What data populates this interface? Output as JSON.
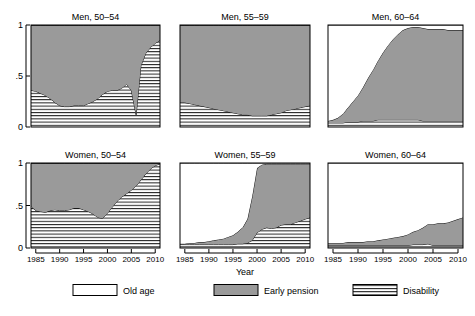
{
  "figure": {
    "xlabel": "Year",
    "ylabel": "",
    "xticks": [
      "1985",
      "1990",
      "1995",
      "2000",
      "2005",
      "2010"
    ],
    "yticks": [
      "0",
      ".5",
      "1"
    ],
    "legend": [
      {
        "key": "old-age",
        "label": "Old age",
        "fill": "#ffffff",
        "pattern": "solid"
      },
      {
        "key": "early-pension",
        "label": "Early pension",
        "fill": "#9a9a9a",
        "pattern": "solid"
      },
      {
        "key": "disability",
        "label": "Disability",
        "fill": "#ffffff",
        "pattern": "horizontal-lines"
      }
    ]
  },
  "chart_data": {
    "type": "area",
    "title": "",
    "xlabel": "Year",
    "ylabel": "",
    "xlim": [
      1984,
      2011
    ],
    "ylim": [
      0,
      1
    ],
    "grid": false,
    "legend_position": "bottom",
    "stack_order": [
      "disability",
      "early_pension",
      "old_age"
    ],
    "panels": [
      {
        "title": "Men, 50–54",
        "row": 0,
        "col": 0,
        "x": [
          1984,
          1985,
          1986,
          1987,
          1988,
          1989,
          1990,
          1991,
          1992,
          1993,
          1994,
          1995,
          1996,
          1997,
          1998,
          1999,
          2000,
          2001,
          2002,
          2003,
          2004,
          2005,
          2006,
          2007,
          2008,
          2009,
          2010,
          2011
        ],
        "series": [
          {
            "name": "Disability",
            "values": [
              0.36,
              0.35,
              0.33,
              0.31,
              0.28,
              0.24,
              0.21,
              0.2,
              0.2,
              0.21,
              0.21,
              0.21,
              0.23,
              0.25,
              0.28,
              0.32,
              0.35,
              0.36,
              0.36,
              0.38,
              0.42,
              0.36,
              0.12,
              0.6,
              0.72,
              0.78,
              0.82,
              0.85
            ]
          },
          {
            "name": "Early pension",
            "values": [
              0.64,
              0.65,
              0.67,
              0.69,
              0.72,
              0.76,
              0.79,
              0.8,
              0.8,
              0.79,
              0.79,
              0.79,
              0.77,
              0.75,
              0.72,
              0.68,
              0.65,
              0.64,
              0.64,
              0.62,
              0.58,
              0.64,
              0.88,
              0.4,
              0.28,
              0.22,
              0.18,
              0.15
            ]
          },
          {
            "name": "Old age",
            "values": [
              0.0,
              0.0,
              0.0,
              0.0,
              0.0,
              0.0,
              0.0,
              0.0,
              0.0,
              0.0,
              0.0,
              0.0,
              0.0,
              0.0,
              0.0,
              0.0,
              0.0,
              0.0,
              0.0,
              0.0,
              0.0,
              0.0,
              0.0,
              0.0,
              0.0,
              0.0,
              0.0,
              0.0
            ]
          }
        ]
      },
      {
        "title": "Men, 55–59",
        "row": 0,
        "col": 1,
        "x": [
          1984,
          1985,
          1986,
          1987,
          1988,
          1989,
          1990,
          1991,
          1992,
          1993,
          1994,
          1995,
          1996,
          1997,
          1998,
          1999,
          2000,
          2001,
          2002,
          2003,
          2004,
          2005,
          2006,
          2007,
          2008,
          2009,
          2010,
          2011
        ],
        "series": [
          {
            "name": "Disability",
            "values": [
              0.24,
              0.24,
              0.23,
              0.22,
              0.21,
              0.2,
              0.19,
              0.18,
              0.17,
              0.16,
              0.15,
              0.14,
              0.13,
              0.12,
              0.12,
              0.11,
              0.11,
              0.11,
              0.11,
              0.12,
              0.13,
              0.14,
              0.16,
              0.17,
              0.18,
              0.19,
              0.2,
              0.21
            ]
          },
          {
            "name": "Early pension",
            "values": [
              0.76,
              0.76,
              0.77,
              0.78,
              0.79,
              0.8,
              0.81,
              0.82,
              0.83,
              0.84,
              0.85,
              0.86,
              0.87,
              0.88,
              0.88,
              0.89,
              0.89,
              0.89,
              0.89,
              0.88,
              0.87,
              0.86,
              0.84,
              0.83,
              0.82,
              0.81,
              0.8,
              0.79
            ]
          },
          {
            "name": "Old age",
            "values": [
              0.0,
              0.0,
              0.0,
              0.0,
              0.0,
              0.0,
              0.0,
              0.0,
              0.0,
              0.0,
              0.0,
              0.0,
              0.0,
              0.0,
              0.0,
              0.0,
              0.0,
              0.0,
              0.0,
              0.0,
              0.0,
              0.0,
              0.0,
              0.0,
              0.0,
              0.0,
              0.0,
              0.0
            ]
          }
        ]
      },
      {
        "title": "Men, 60–64",
        "row": 0,
        "col": 2,
        "x": [
          1984,
          1985,
          1986,
          1987,
          1988,
          1989,
          1990,
          1991,
          1992,
          1993,
          1994,
          1995,
          1996,
          1997,
          1998,
          1999,
          2000,
          2001,
          2002,
          2003,
          2004,
          2005,
          2006,
          2007,
          2008,
          2009,
          2010,
          2011
        ],
        "series": [
          {
            "name": "Disability",
            "values": [
              0.04,
              0.04,
              0.04,
              0.04,
              0.05,
              0.05,
              0.05,
              0.06,
              0.06,
              0.06,
              0.07,
              0.07,
              0.07,
              0.07,
              0.07,
              0.07,
              0.07,
              0.07,
              0.07,
              0.06,
              0.06,
              0.06,
              0.06,
              0.06,
              0.06,
              0.06,
              0.06,
              0.06
            ]
          },
          {
            "name": "Early pension",
            "values": [
              0.02,
              0.03,
              0.05,
              0.09,
              0.14,
              0.2,
              0.26,
              0.33,
              0.42,
              0.5,
              0.58,
              0.66,
              0.73,
              0.79,
              0.84,
              0.88,
              0.9,
              0.91,
              0.91,
              0.91,
              0.9,
              0.9,
              0.9,
              0.9,
              0.89,
              0.89,
              0.89,
              0.89
            ]
          },
          {
            "name": "Old age",
            "values": [
              0.94,
              0.93,
              0.91,
              0.87,
              0.81,
              0.75,
              0.69,
              0.61,
              0.52,
              0.44,
              0.35,
              0.27,
              0.2,
              0.14,
              0.09,
              0.05,
              0.03,
              0.02,
              0.02,
              0.03,
              0.04,
              0.04,
              0.04,
              0.04,
              0.05,
              0.05,
              0.05,
              0.05
            ]
          }
        ]
      },
      {
        "title": "Women, 50–54",
        "row": 1,
        "col": 0,
        "x": [
          1984,
          1985,
          1986,
          1987,
          1988,
          1989,
          1990,
          1991,
          1992,
          1993,
          1994,
          1995,
          1996,
          1997,
          1998,
          1999,
          2000,
          2001,
          2002,
          2003,
          2004,
          2005,
          2006,
          2007,
          2008,
          2009,
          2010,
          2011
        ],
        "series": [
          {
            "name": "Disability",
            "values": [
              0.49,
              0.44,
              0.43,
              0.42,
              0.44,
              0.45,
              0.44,
              0.44,
              0.45,
              0.47,
              0.47,
              0.45,
              0.43,
              0.4,
              0.36,
              0.35,
              0.41,
              0.48,
              0.55,
              0.6,
              0.64,
              0.68,
              0.73,
              0.8,
              0.87,
              0.93,
              0.97,
              0.99
            ]
          },
          {
            "name": "Early pension",
            "values": [
              0.51,
              0.56,
              0.57,
              0.58,
              0.56,
              0.55,
              0.56,
              0.56,
              0.55,
              0.53,
              0.53,
              0.55,
              0.57,
              0.6,
              0.64,
              0.65,
              0.59,
              0.52,
              0.45,
              0.4,
              0.36,
              0.32,
              0.27,
              0.2,
              0.13,
              0.07,
              0.03,
              0.01
            ]
          },
          {
            "name": "Old age",
            "values": [
              0.0,
              0.0,
              0.0,
              0.0,
              0.0,
              0.0,
              0.0,
              0.0,
              0.0,
              0.0,
              0.0,
              0.0,
              0.0,
              0.0,
              0.0,
              0.0,
              0.0,
              0.0,
              0.0,
              0.0,
              0.0,
              0.0,
              0.0,
              0.0,
              0.0,
              0.0,
              0.0,
              0.0
            ]
          }
        ]
      },
      {
        "title": "Women, 55–59",
        "row": 1,
        "col": 1,
        "x": [
          1984,
          1985,
          1986,
          1987,
          1988,
          1989,
          1990,
          1991,
          1992,
          1993,
          1994,
          1995,
          1996,
          1997,
          1998,
          1999,
          2000,
          2001,
          2002,
          2003,
          2004,
          2005,
          2006,
          2007,
          2008,
          2009,
          2010,
          2011
        ],
        "series": [
          {
            "name": "Disability",
            "values": [
              0.04,
              0.04,
              0.04,
              0.04,
              0.04,
              0.04,
              0.04,
              0.04,
              0.04,
              0.04,
              0.04,
              0.04,
              0.05,
              0.05,
              0.06,
              0.09,
              0.18,
              0.22,
              0.24,
              0.23,
              0.24,
              0.27,
              0.28,
              0.28,
              0.3,
              0.32,
              0.34,
              0.36
            ]
          },
          {
            "name": "Early pension",
            "values": [
              0.01,
              0.01,
              0.02,
              0.02,
              0.03,
              0.03,
              0.04,
              0.05,
              0.06,
              0.07,
              0.09,
              0.11,
              0.14,
              0.19,
              0.28,
              0.52,
              0.76,
              0.76,
              0.75,
              0.76,
              0.75,
              0.72,
              0.71,
              0.71,
              0.69,
              0.67,
              0.65,
              0.63
            ]
          },
          {
            "name": "Old age",
            "values": [
              0.95,
              0.95,
              0.94,
              0.94,
              0.93,
              0.93,
              0.92,
              0.91,
              0.9,
              0.89,
              0.87,
              0.85,
              0.81,
              0.76,
              0.66,
              0.39,
              0.06,
              0.02,
              0.01,
              0.01,
              0.01,
              0.01,
              0.01,
              0.01,
              0.01,
              0.01,
              0.01,
              0.01
            ]
          }
        ]
      },
      {
        "title": "Women, 60–64",
        "row": 1,
        "col": 2,
        "x": [
          1984,
          1985,
          1986,
          1987,
          1988,
          1989,
          1990,
          1991,
          1992,
          1993,
          1994,
          1995,
          1996,
          1997,
          1998,
          1999,
          2000,
          2001,
          2002,
          2003,
          2004,
          2005,
          2006,
          2007,
          2008,
          2009,
          2010,
          2011
        ],
        "series": [
          {
            "name": "Disability",
            "values": [
              0.03,
              0.03,
              0.03,
              0.03,
              0.03,
              0.03,
              0.03,
              0.03,
              0.03,
              0.03,
              0.03,
              0.03,
              0.03,
              0.03,
              0.03,
              0.03,
              0.03,
              0.04,
              0.04,
              0.04,
              0.05,
              0.03,
              0.03,
              0.03,
              0.03,
              0.03,
              0.03,
              0.03
            ]
          },
          {
            "name": "Early pension",
            "values": [
              0.03,
              0.03,
              0.03,
              0.03,
              0.04,
              0.04,
              0.04,
              0.04,
              0.05,
              0.05,
              0.06,
              0.07,
              0.08,
              0.09,
              0.1,
              0.11,
              0.13,
              0.15,
              0.17,
              0.2,
              0.23,
              0.25,
              0.26,
              0.26,
              0.27,
              0.29,
              0.31,
              0.33
            ]
          },
          {
            "name": "Old age",
            "values": [
              0.94,
              0.94,
              0.94,
              0.94,
              0.93,
              0.93,
              0.93,
              0.93,
              0.92,
              0.92,
              0.91,
              0.9,
              0.89,
              0.88,
              0.87,
              0.86,
              0.84,
              0.81,
              0.79,
              0.76,
              0.72,
              0.72,
              0.71,
              0.71,
              0.7,
              0.68,
              0.66,
              0.64
            ]
          }
        ]
      }
    ]
  }
}
